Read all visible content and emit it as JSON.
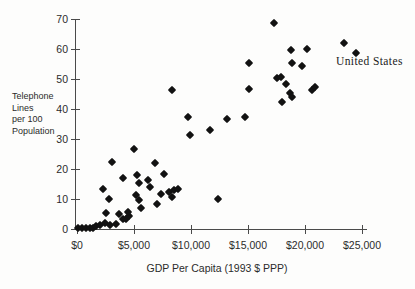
{
  "chart_data": {
    "type": "scatter",
    "title": "",
    "xlabel": "GDP Per Capita (1993 $ PPP)",
    "ylabel": "Telephone\nLines\nper 100\nPopulation",
    "xlim": [
      0,
      25000
    ],
    "ylim": [
      0,
      70
    ],
    "grid": "off",
    "legend": "none",
    "x_ticks": {
      "values": [
        0,
        5000,
        10000,
        15000,
        20000,
        25000
      ],
      "labels": [
        "$0",
        "$5,000",
        "$10,000",
        "$15,000",
        "$20,000",
        "$25,000"
      ]
    },
    "y_ticks": {
      "values": [
        0,
        10,
        20,
        30,
        40,
        50,
        60,
        70
      ],
      "labels": [
        "0",
        "10",
        "20",
        "30",
        "40",
        "50",
        "60",
        "70"
      ]
    },
    "marker": {
      "shape": "diamond",
      "color": "#121212"
    },
    "annotation": {
      "text": "United States",
      "x": 24500,
      "y": 58.6
    },
    "points": [
      [
        100,
        0.3
      ],
      [
        450,
        0.2
      ],
      [
        800,
        0.3
      ],
      [
        1100,
        0.5
      ],
      [
        1400,
        0.3
      ],
      [
        1700,
        0.9
      ],
      [
        2050,
        1.3
      ],
      [
        2450,
        1.9
      ],
      [
        2900,
        1.2
      ],
      [
        3400,
        1.7
      ],
      [
        4000,
        3.2
      ],
      [
        4300,
        3.3
      ],
      [
        4550,
        4.2
      ],
      [
        4500,
        5.8
      ],
      [
        2500,
        5.5
      ],
      [
        3700,
        5.1
      ],
      [
        2850,
        10
      ],
      [
        2250,
        13.4
      ],
      [
        3100,
        22.5
      ],
      [
        4050,
        17
      ],
      [
        5300,
        18
      ],
      [
        5450,
        15.3
      ],
      [
        5000,
        26.8
      ],
      [
        6850,
        22
      ],
      [
        7600,
        18.5
      ],
      [
        6250,
        16.2
      ],
      [
        6400,
        14
      ],
      [
        5200,
        11.5
      ],
      [
        5450,
        9.8
      ],
      [
        5600,
        6.9
      ],
      [
        7050,
        8.2
      ],
      [
        7400,
        11.7
      ],
      [
        8100,
        12.2
      ],
      [
        8500,
        13
      ],
      [
        8900,
        13.3
      ],
      [
        8300,
        10.7
      ],
      [
        12350,
        10
      ],
      [
        9900,
        31.5
      ],
      [
        9750,
        37.5
      ],
      [
        11700,
        33
      ],
      [
        13200,
        36.8
      ],
      [
        14750,
        37.2
      ],
      [
        8300,
        46.2
      ],
      [
        15100,
        46.6
      ],
      [
        15050,
        55.2
      ],
      [
        17300,
        68.7
      ],
      [
        18750,
        59.8
      ],
      [
        20150,
        60
      ],
      [
        23400,
        62
      ],
      [
        24500,
        58.6
      ],
      [
        18900,
        55.2
      ],
      [
        19750,
        54.3
      ],
      [
        17500,
        50.3
      ],
      [
        17900,
        50.7
      ],
      [
        18350,
        48.5
      ],
      [
        18650,
        45.3
      ],
      [
        18900,
        44
      ],
      [
        18000,
        42.4
      ],
      [
        20600,
        46.4
      ],
      [
        20850,
        47.3
      ]
    ]
  }
}
